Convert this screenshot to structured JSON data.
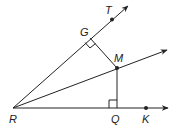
{
  "diagram": {
    "type": "geometry",
    "colors": {
      "stroke": "#222222",
      "background": "#ffffff"
    },
    "points": {
      "R": {
        "label": "R"
      },
      "G": {
        "label": "G"
      },
      "T": {
        "label": "T"
      },
      "M": {
        "label": "M"
      },
      "Q": {
        "label": "Q"
      },
      "K": {
        "label": "K"
      }
    },
    "rays": [
      {
        "name": "ray-RT",
        "from": "R",
        "through": "T"
      },
      {
        "name": "ray-RM",
        "from": "R",
        "through": "M"
      },
      {
        "name": "ray-RK",
        "from": "R",
        "through": "K"
      }
    ],
    "segments": [
      {
        "name": "segment-MG",
        "from": "M",
        "to": "G"
      },
      {
        "name": "segment-MQ",
        "from": "M",
        "to": "Q"
      }
    ],
    "right_angles": [
      "G",
      "Q"
    ]
  }
}
